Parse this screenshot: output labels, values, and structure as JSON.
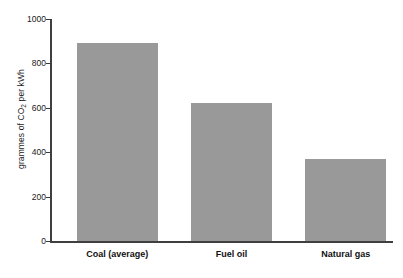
{
  "chart_data": {
    "type": "bar",
    "title": "",
    "xlabel": "",
    "ylabel": "grammes of CO2 per kWh",
    "ylabel_parts": {
      "pre": "grammes of CO",
      "sub": "2",
      "post": " per kWh"
    },
    "categories": [
      "Coal (average)",
      "Fuel oil",
      "Natural gas"
    ],
    "values": [
      890,
      620,
      370
    ],
    "ylim": [
      0,
      1000
    ],
    "yticks": [
      0,
      200,
      400,
      600,
      800,
      1000
    ],
    "ytick_labels": [
      "0",
      "200",
      "400",
      "600",
      "800",
      "1000"
    ],
    "grid": false,
    "legend": null,
    "legend_position": "none",
    "bar_color": "#999999",
    "axis_color": "#3f3f3f",
    "text_color": "#1a1a1a"
  }
}
